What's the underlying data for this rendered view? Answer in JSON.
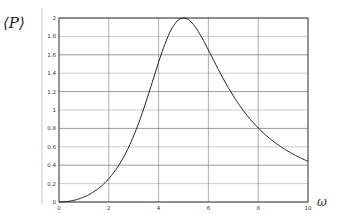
{
  "chart_data": {
    "type": "line",
    "title": "",
    "xlabel": "ω",
    "ylabel": "⟨P⟩",
    "xlim": [
      0,
      10
    ],
    "ylim": [
      0,
      2
    ],
    "grid": true,
    "legend": null,
    "x_ticks": [
      "0",
      "2",
      "4",
      "6",
      "8",
      "10"
    ],
    "y_ticks": [
      "0",
      "0.2",
      "0.4",
      "0.6",
      "0.8",
      "1",
      "1.2",
      "1.4",
      "1.6",
      "1.8",
      "2"
    ],
    "series": [
      {
        "name": "⟨P⟩(ω)",
        "x": [
          0,
          0.5,
          1,
          1.5,
          2,
          2.5,
          3,
          3.5,
          4,
          4.5,
          5,
          5.5,
          6,
          6.5,
          7,
          7.5,
          8,
          8.5,
          9,
          9.5,
          10
        ],
        "values": [
          0,
          0.013,
          0.055,
          0.13,
          0.25,
          0.44,
          0.72,
          1.09,
          1.52,
          1.88,
          2.0,
          1.88,
          1.55,
          1.24,
          1.0,
          0.83,
          0.8,
          0.62,
          0.55,
          0.5,
          0.45
        ]
      }
    ]
  },
  "labels": {
    "y_axis": "⟨P⟩",
    "x_axis": "ω"
  },
  "colors": {
    "curve": "#222222",
    "grid": "#555555",
    "axis": "#333333"
  }
}
